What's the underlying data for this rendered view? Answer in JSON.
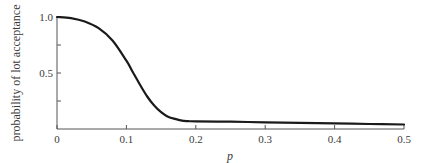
{
  "chart_data": {
    "type": "line",
    "title": "",
    "xlabel": "p",
    "ylabel": "probability of lot acceptance",
    "xlim": [
      0,
      0.5
    ],
    "ylim": [
      0,
      1.0
    ],
    "xticks": [
      "0",
      "0.1",
      "0.2",
      "0.3",
      "0.4",
      "0.5"
    ],
    "yticks": [
      "0.5",
      "1.0"
    ],
    "y_minor_ticks": [
      0.25,
      0.75
    ],
    "grid": false,
    "legend": null,
    "series": [
      {
        "name": "OC curve",
        "color": "#1a1a1a",
        "x": [
          0,
          0.02,
          0.04,
          0.06,
          0.08,
          0.1,
          0.11,
          0.12,
          0.13,
          0.14,
          0.15,
          0.16,
          0.17,
          0.18,
          0.19,
          0.2,
          0.25,
          0.3,
          0.35,
          0.4,
          0.45,
          0.5
        ],
        "y": [
          1.0,
          0.99,
          0.96,
          0.9,
          0.79,
          0.61,
          0.5,
          0.39,
          0.29,
          0.21,
          0.15,
          0.11,
          0.09,
          0.075,
          0.07,
          0.068,
          0.065,
          0.06,
          0.055,
          0.05,
          0.045,
          0.04
        ]
      }
    ]
  }
}
